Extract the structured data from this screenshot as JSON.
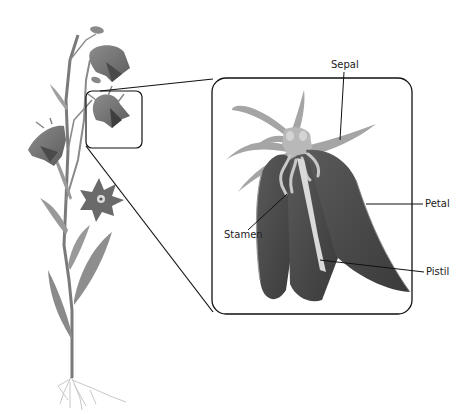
{
  "diagram": {
    "labels": {
      "sepal": "Sepal",
      "petal": "Petal",
      "stamen": "Stamen",
      "pistil": "Pistil"
    }
  }
}
